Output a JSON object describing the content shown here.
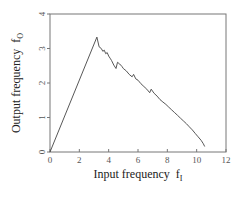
{
  "chart_data": {
    "type": "line",
    "title": "",
    "xlabel": "Input frequency",
    "xlabel_sub": "I",
    "xlabel_symbol": "f",
    "ylabel": "Output frequency",
    "ylabel_sub": "O",
    "ylabel_symbol": "f",
    "xlim": [
      0,
      12
    ],
    "ylim": [
      0,
      4
    ],
    "xticks": [
      0,
      2,
      4,
      6,
      8,
      10,
      12
    ],
    "yticks": [
      0,
      1,
      2,
      3,
      4
    ],
    "grid": false,
    "legend": null,
    "series": [
      {
        "name": "output vs input frequency",
        "x": [
          0,
          3.2,
          3.35,
          3.5,
          3.6,
          3.7,
          3.8,
          3.9,
          4.0,
          4.1,
          4.2,
          4.35,
          4.5,
          4.6,
          4.75,
          4.9,
          5.0,
          5.2,
          5.4,
          5.6,
          5.7,
          5.85,
          6.0,
          6.2,
          6.4,
          6.6,
          6.8,
          6.9,
          7.1,
          7.3,
          7.5,
          7.7,
          7.9,
          8.1,
          8.3,
          8.5,
          8.7,
          8.9,
          9.1,
          9.3,
          9.5,
          9.7,
          9.9,
          10.1,
          10.3,
          10.45,
          10.55
        ],
        "y": [
          0,
          3.33,
          3.05,
          3.0,
          2.92,
          2.95,
          2.85,
          2.88,
          2.78,
          2.72,
          2.65,
          2.52,
          2.42,
          2.6,
          2.55,
          2.48,
          2.42,
          2.35,
          2.25,
          2.18,
          2.25,
          2.12,
          2.08,
          1.98,
          1.9,
          1.82,
          1.72,
          1.82,
          1.7,
          1.62,
          1.52,
          1.45,
          1.38,
          1.3,
          1.22,
          1.14,
          1.06,
          0.98,
          0.9,
          0.82,
          0.73,
          0.64,
          0.54,
          0.44,
          0.34,
          0.24,
          0.16
        ]
      }
    ]
  }
}
